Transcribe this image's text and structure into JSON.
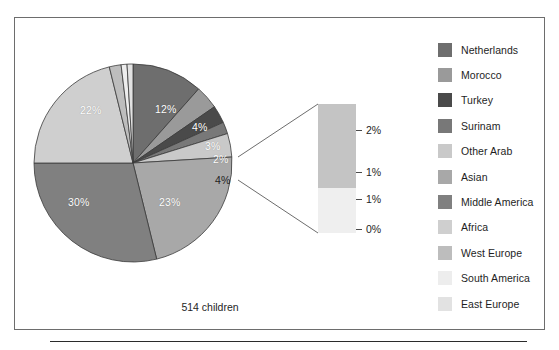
{
  "figure": {
    "caption": "514 children",
    "frame_color": "#6d6d6d",
    "rule_color": "#2b2b2b"
  },
  "chart_data": {
    "type": "pie",
    "title": "",
    "categories": [
      "Netherlands",
      "Morocco",
      "Turkey",
      "Surinam",
      "Other Arab",
      "Asian",
      "Middle America",
      "Africa",
      "West Europe",
      "South America",
      "East Europe"
    ],
    "values": [
      12,
      4,
      3,
      2,
      4,
      23,
      30,
      22,
      2,
      1,
      1
    ],
    "value_labels": [
      "12%",
      "4%",
      "3%",
      "2%",
      "4%",
      "23%",
      "30%",
      "22%",
      "2%",
      "1%",
      "1%"
    ],
    "displayed_slice_labels": [
      "12%",
      "4%",
      "3%",
      "2%",
      "4%",
      "23%",
      "30%",
      "22%"
    ],
    "colors": [
      "#6e6e6e",
      "#9a9a9a",
      "#4a4a4a",
      "#787878",
      "#c9c9c9",
      "#a8a8a8",
      "#808080",
      "#cfcfcf",
      "#bdbdbd",
      "#ededed",
      "#e2e2e2"
    ],
    "legend_position": "right",
    "total_label": "514 children",
    "inset": {
      "type": "magnified-bar",
      "tick_labels": [
        "2%",
        "1%",
        "1%",
        "0%"
      ],
      "bands": [
        {
          "label": "2%",
          "color": "#c4c4c4"
        },
        {
          "label": "1%",
          "color": "#efefef"
        }
      ]
    }
  },
  "legend": {
    "items": [
      {
        "label": "Netherlands",
        "color": "#6e6e6e"
      },
      {
        "label": "Morocco",
        "color": "#9a9a9a"
      },
      {
        "label": "Turkey",
        "color": "#4a4a4a"
      },
      {
        "label": "Surinam",
        "color": "#787878"
      },
      {
        "label": "Other Arab",
        "color": "#c9c9c9"
      },
      {
        "label": "Asian",
        "color": "#a8a8a8"
      },
      {
        "label": "Middle America",
        "color": "#808080"
      },
      {
        "label": "Africa",
        "color": "#cfcfcf"
      },
      {
        "label": "West Europe",
        "color": "#bdbdbd"
      },
      {
        "label": "South America",
        "color": "#ededed"
      },
      {
        "label": "East Europe",
        "color": "#e2e2e2"
      }
    ]
  },
  "pie_labels": [
    {
      "text": "12%",
      "x": 155,
      "y": 103,
      "tone": "light"
    },
    {
      "text": "4%",
      "x": 192,
      "y": 121,
      "tone": "light"
    },
    {
      "text": "3%",
      "x": 205,
      "y": 140,
      "tone": "light"
    },
    {
      "text": "2%",
      "x": 213,
      "y": 153,
      "tone": "light"
    },
    {
      "text": "4%",
      "x": 215,
      "y": 174,
      "tone": "dark"
    },
    {
      "text": "23%",
      "x": 159,
      "y": 196,
      "tone": "light"
    },
    {
      "text": "30%",
      "x": 68,
      "y": 196,
      "tone": "light"
    },
    {
      "text": "22%",
      "x": 80,
      "y": 104,
      "tone": "light"
    }
  ],
  "inset_ticks": [
    {
      "label": "2%",
      "top": 20
    },
    {
      "label": "1%",
      "top": 62
    },
    {
      "label": "1%",
      "top": 89
    },
    {
      "label": "0%",
      "top": 119
    }
  ]
}
